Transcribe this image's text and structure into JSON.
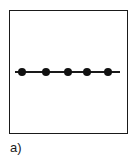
{
  "figure": {
    "caption": "a)",
    "frame": {
      "x": 9,
      "y": 10,
      "width": 119,
      "height": 124
    },
    "line": {
      "x1": 15,
      "x2": 120,
      "y": 72,
      "color": "#1a1a1a"
    },
    "nodes": [
      {
        "x": 22,
        "y": 72,
        "r": 4
      },
      {
        "x": 46,
        "y": 72,
        "r": 4
      },
      {
        "x": 68,
        "y": 72,
        "r": 4
      },
      {
        "x": 87,
        "y": 72,
        "r": 4
      },
      {
        "x": 108,
        "y": 72,
        "r": 4
      }
    ],
    "node_color": "#111111"
  }
}
